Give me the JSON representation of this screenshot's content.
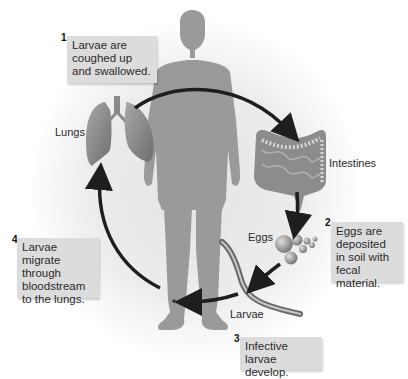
{
  "diagram": {
    "labels": {
      "lungs": "Lungs",
      "intestines": "Intestines",
      "eggs": "Eggs",
      "larvae": "Larvae"
    },
    "steps": [
      {
        "number": "1",
        "text": "Larvae are coughed up and swallowed."
      },
      {
        "number": "2",
        "text": "Eggs are deposited in soil with fecal material."
      },
      {
        "number": "3",
        "text": "Infective larvae develop."
      },
      {
        "number": "4",
        "text": "Larvae migrate through bloodstream to the lungs."
      }
    ],
    "colors": {
      "silhouette": "#9a9a9a",
      "callout_bg": "#dcdcdc",
      "arrow": "#1e1e1e",
      "organ": "#8c8c8c"
    }
  }
}
